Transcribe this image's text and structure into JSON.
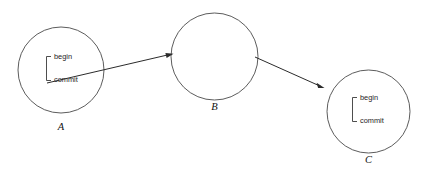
{
  "diagram": {
    "background_color": "#ffffff",
    "stroke_color": "#3a3a3a",
    "text_color": "#1c1c1c",
    "nodes": [
      {
        "id": "A",
        "label": "A",
        "cx": 61,
        "cy": 70,
        "r": 43,
        "has_transaction": true,
        "transaction": {
          "begin": "begin",
          "commit": "commit"
        }
      },
      {
        "id": "B",
        "label": "B",
        "cx": 214.5,
        "cy": 56.5,
        "r": 43.5,
        "has_transaction": false,
        "transaction": {
          "begin": "",
          "commit": ""
        }
      },
      {
        "id": "C",
        "label": "C",
        "cx": 368.5,
        "cy": 111.5,
        "r": 41.5,
        "has_transaction": true,
        "transaction": {
          "begin": "begin",
          "commit": "commit"
        }
      }
    ],
    "edges": [
      {
        "id": "A-to-B",
        "from": "A",
        "to": "B",
        "x1": 47,
        "y1": 83,
        "x2": 172,
        "y2": 54
      },
      {
        "id": "B-to-C",
        "from": "B",
        "to": "C",
        "x1": 255,
        "y1": 57,
        "x2": 324,
        "y2": 88
      }
    ]
  }
}
